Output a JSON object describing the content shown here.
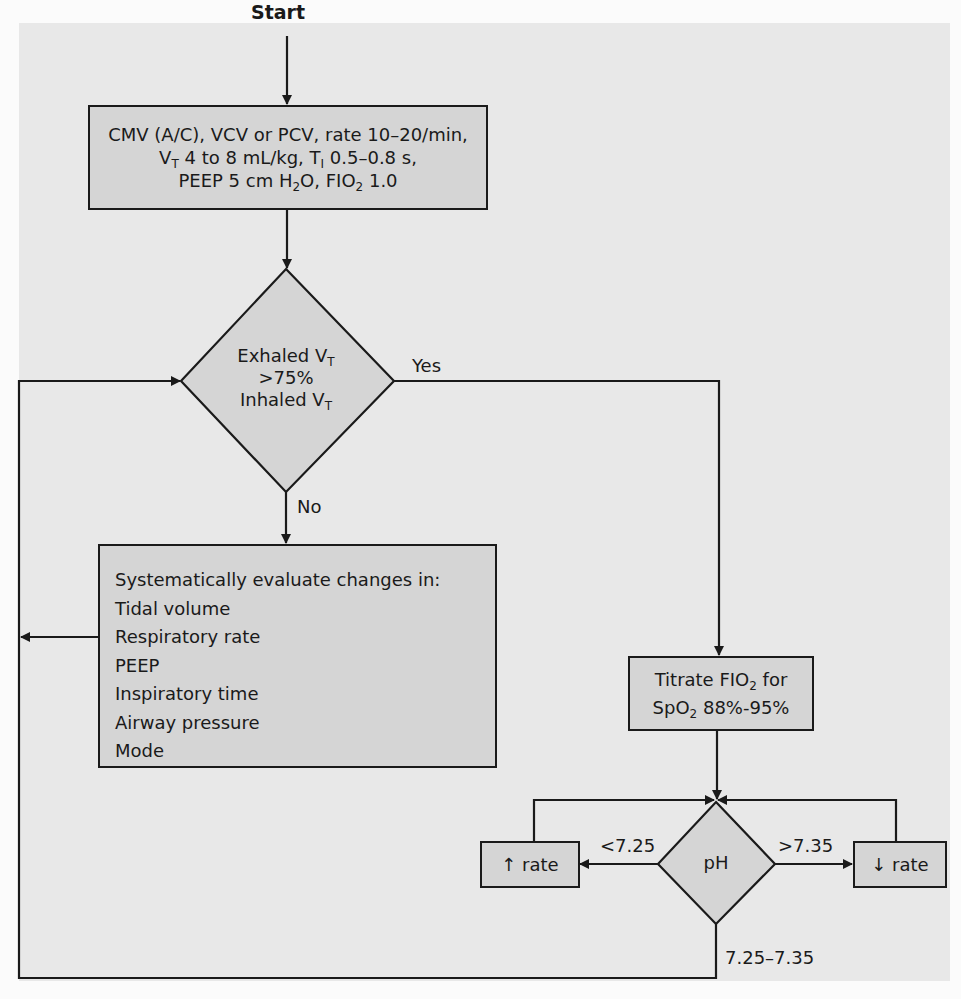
{
  "diagram": {
    "type": "flowchart",
    "start_label": "Start",
    "initial_settings": {
      "line1": "CMV (A/C), VCV or PCV, rate 10–20/min,",
      "line2_prefix": "V",
      "line2_sub": "T",
      "line2_mid": " 4 to 8 mL/kg, T",
      "line2_sub2": "I",
      "line2_suffix": " 0.5–0.8 s,",
      "line3_prefix": "PEEP 5 cm H",
      "line3_sub": "2",
      "line3_mid": "O, FIO",
      "line3_sub2": "2",
      "line3_suffix": " 1.0"
    },
    "decision_vt": {
      "line1_prefix": "Exhaled V",
      "line1_sub": "T",
      "line2": ">75%",
      "line3_prefix": "Inhaled V",
      "line3_sub": "T",
      "yes_label": "Yes",
      "no_label": "No"
    },
    "evaluate_box": {
      "title": "Systematically evaluate changes in:",
      "items": [
        "Tidal volume",
        "Respiratory rate",
        "PEEP",
        "Inspiratory time",
        "Airway pressure",
        "Mode"
      ]
    },
    "titrate_box": {
      "line1_prefix": "Titrate FIO",
      "line1_sub": "2",
      "line1_suffix": " for",
      "line2_prefix": "SpO",
      "line2_sub": "2",
      "line2_suffix": " 88%-95%"
    },
    "decision_ph": {
      "label": "pH",
      "low_label": "<7.25",
      "high_label": ">7.35",
      "normal_label": "7.25–7.35"
    },
    "increase_rate": {
      "arrow": "↑",
      "label": " rate"
    },
    "decrease_rate": {
      "arrow": "↓",
      "label": " rate"
    },
    "colors": {
      "box_fill": "#d5d5d5",
      "background": "#e8e8e8",
      "line": "#1a1a1a"
    }
  }
}
